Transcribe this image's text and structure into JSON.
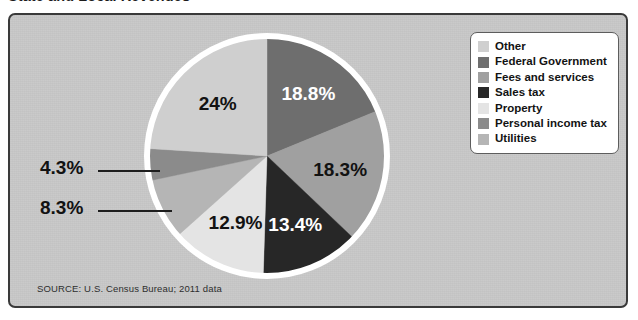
{
  "figure": {
    "title": "State and Local Revenues",
    "source_note": "SOURCE: U.S. Census Bureau; 2011 data",
    "watermark": "",
    "frame_color": "#3a3a3a",
    "background_color": "#c8c8c8"
  },
  "legend": {
    "items": [
      {
        "label": "Other",
        "color": "#cfcfcf"
      },
      {
        "label": "Federal Government",
        "color": "#6e6e6e"
      },
      {
        "label": "Fees and services",
        "color": "#a0a0a0"
      },
      {
        "label": "Sales tax",
        "color": "#272727"
      },
      {
        "label": "Property",
        "color": "#e4e4e4"
      },
      {
        "label": "Personal income tax",
        "color": "#8b8b8b"
      },
      {
        "label": "Utilities",
        "color": "#b5b5b5"
      }
    ]
  },
  "callouts": [
    {
      "name": "personal-income-tax",
      "value": "4.3%"
    },
    {
      "name": "utilities",
      "value": "8.3%"
    }
  ],
  "chart_data": {
    "type": "pie",
    "title": "State and Local Revenues",
    "subtitle": "",
    "xlabel": "",
    "ylabel": "",
    "units": "percent",
    "start_angle_deg": 0,
    "direction": "clockwise",
    "legend_position": "top-right",
    "grid": false,
    "categories": [
      "Federal Government",
      "Fees and services",
      "Sales tax",
      "Property",
      "Utilities",
      "Personal income tax",
      "Other"
    ],
    "values": [
      18.8,
      18.3,
      13.4,
      12.9,
      8.3,
      4.3,
      24.0
    ],
    "labels": [
      "18.8%",
      "18.3%",
      "13.4%",
      "12.9%",
      "8.3%",
      "4.3%",
      "24%"
    ],
    "colors": [
      "#6e6e6e",
      "#a0a0a0",
      "#272727",
      "#e4e4e4",
      "#b5b5b5",
      "#8b8b8b",
      "#cfcfcf"
    ],
    "label_placement": [
      "inside",
      "inside",
      "inside",
      "inside",
      "callout",
      "callout",
      "inside"
    ],
    "label_text_colors": [
      "#ffffff",
      "#121212",
      "#ffffff",
      "#121212",
      "#121212",
      "#121212",
      "#121212"
    ],
    "slices": [
      {
        "category": "Federal Government",
        "value": 18.8,
        "label": "18.8%",
        "color": "#6e6e6e"
      },
      {
        "category": "Fees and services",
        "value": 18.3,
        "label": "18.3%",
        "color": "#a0a0a0"
      },
      {
        "category": "Sales tax",
        "value": 13.4,
        "label": "13.4%",
        "color": "#272727"
      },
      {
        "category": "Property",
        "value": 12.9,
        "label": "12.9%",
        "color": "#e4e4e4"
      },
      {
        "category": "Utilities",
        "value": 8.3,
        "label": "8.3%",
        "color": "#b5b5b5"
      },
      {
        "category": "Personal income tax",
        "value": 4.3,
        "label": "4.3%",
        "color": "#8b8b8b"
      },
      {
        "category": "Other",
        "value": 24.0,
        "label": "24%",
        "color": "#cfcfcf"
      }
    ],
    "total": 100.0
  }
}
